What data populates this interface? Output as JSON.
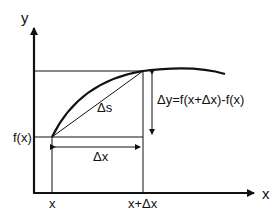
{
  "diagram": {
    "axes": {
      "x_label": "x",
      "y_label": "y"
    },
    "labels": {
      "fx": "f(x)",
      "x_tick": "x",
      "x_dx_tick": "x+Δx",
      "delta_s": "Δs",
      "delta_x": "Δx",
      "delta_y": "Δy=f(x+Δx)-f(x)"
    },
    "colors": {
      "stroke": "#111111",
      "background": "#ffffff"
    }
  }
}
